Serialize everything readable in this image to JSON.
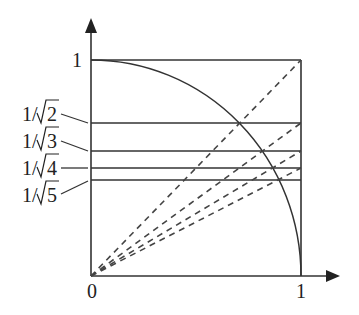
{
  "diagram": {
    "axes": {
      "x_origin_label": "0",
      "x_end_label": "1",
      "y_top_label": "1"
    },
    "y_labels": [
      {
        "text_pre": "1/",
        "radicand": "2",
        "value": 0.7071
      },
      {
        "text_pre": "1/",
        "radicand": "3",
        "value": 0.5774
      },
      {
        "text_pre": "1/",
        "radicand": "4",
        "value": 0.5
      },
      {
        "text_pre": "1/",
        "radicand": "5",
        "value": 0.4472
      }
    ],
    "curves": {
      "quarter_circle": "x^2 + y^2 = 1",
      "dashed_rays": [
        "slope 1",
        "slope 1/sqrt(2)",
        "slope 1/sqrt(3)",
        "slope 1/2"
      ]
    },
    "colors": {
      "line": "#333333",
      "background": "#ffffff"
    }
  }
}
